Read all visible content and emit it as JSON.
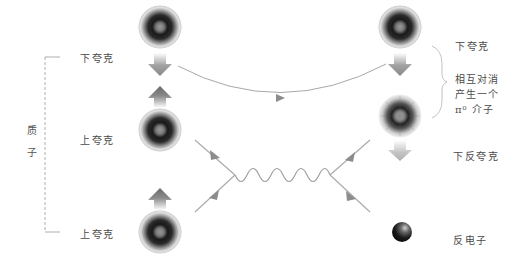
{
  "diagram": {
    "type": "feynman-diagram",
    "group_label": {
      "chars": [
        "质",
        "子"
      ]
    },
    "left_particles": [
      {
        "id": "q1",
        "label": "下夸克",
        "spin": "down"
      },
      {
        "id": "q2",
        "label": "上夸克",
        "spin": "up"
      },
      {
        "id": "q3",
        "label": "上夸克",
        "spin": "up"
      }
    ],
    "right_particles": [
      {
        "id": "r1",
        "label": "下夸克",
        "spin": "down"
      },
      {
        "id": "r2",
        "label": "下反夸克",
        "spin": "down"
      },
      {
        "id": "r3",
        "label": "反电子"
      }
    ],
    "annotation": {
      "lines": [
        "相互对消",
        "产生一个",
        "π⁰ 介子"
      ]
    },
    "colors": {
      "line": "#a8a8a8",
      "arrow": "#8c8c8c",
      "particle_dark": "#1e1e1e",
      "background": "#ffffff"
    }
  }
}
